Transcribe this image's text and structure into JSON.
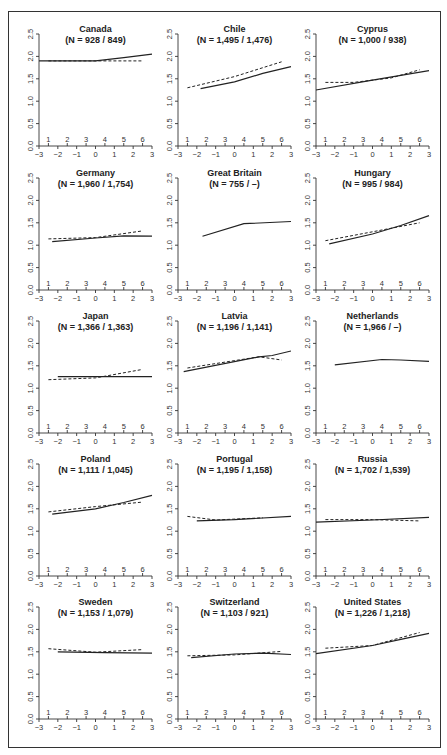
{
  "chart_data": {
    "type": "line",
    "layout": {
      "rows": 5,
      "cols": 3,
      "grid": false,
      "legend": "none"
    },
    "xlim": [
      -3,
      3
    ],
    "ylim": [
      0,
      2.5
    ],
    "x_ticks": [
      "−3",
      "−2",
      "−1",
      "0",
      "1",
      "2",
      "3"
    ],
    "y_ticks": [
      "0.0",
      "0.5",
      "1.0",
      "1.5",
      "2.0",
      "2.5"
    ],
    "inner_tick_labels": [
      "1",
      "2",
      "3",
      "4",
      "5",
      "6"
    ],
    "inner_tick_x": [
      -2.5,
      -1.5,
      -0.5,
      0.5,
      1.5,
      2.5
    ],
    "series_names": [
      "solid",
      "dashed"
    ],
    "panels": [
      {
        "title": "Canada",
        "n": "(N = 928 / 849)",
        "solid": [
          [
            -3,
            1.9
          ],
          [
            0,
            1.9
          ],
          [
            1.5,
            1.97
          ],
          [
            3,
            2.05
          ]
        ],
        "dashed": [
          [
            -2.5,
            1.9
          ],
          [
            2.5,
            1.9
          ]
        ]
      },
      {
        "title": "Chile",
        "n": "(N = 1,495 / 1,476)",
        "solid": [
          [
            -1.8,
            1.28
          ],
          [
            0,
            1.43
          ],
          [
            1.5,
            1.62
          ],
          [
            3,
            1.77
          ]
        ],
        "dashed": [
          [
            -2.5,
            1.3
          ],
          [
            0,
            1.55
          ],
          [
            2.5,
            1.88
          ]
        ]
      },
      {
        "title": "Cyprus",
        "n": "(N = 1,000 / 938)",
        "solid": [
          [
            -3,
            1.25
          ],
          [
            0,
            1.47
          ],
          [
            3,
            1.68
          ]
        ],
        "dashed": [
          [
            -2.5,
            1.42
          ],
          [
            -1,
            1.42
          ],
          [
            1,
            1.52
          ],
          [
            2.5,
            1.7
          ]
        ]
      },
      {
        "title": "Germany",
        "n": "(N = 1,960 / 1,754)",
        "solid": [
          [
            -2.3,
            1.08
          ],
          [
            0,
            1.16
          ],
          [
            1.5,
            1.21
          ],
          [
            3,
            1.2
          ]
        ],
        "dashed": [
          [
            -2.5,
            1.14
          ],
          [
            0,
            1.17
          ],
          [
            2.5,
            1.32
          ]
        ]
      },
      {
        "title": "Great Britain",
        "n": "(N = 755 / –)",
        "solid": [
          [
            -1.7,
            1.2
          ],
          [
            0.5,
            1.48
          ],
          [
            3,
            1.53
          ]
        ],
        "dashed": []
      },
      {
        "title": "Hungary",
        "n": "(N = 995 / 984)",
        "solid": [
          [
            -2.3,
            1.03
          ],
          [
            0,
            1.25
          ],
          [
            1.5,
            1.44
          ],
          [
            3,
            1.66
          ]
        ],
        "dashed": [
          [
            -2.5,
            1.1
          ],
          [
            0,
            1.3
          ],
          [
            2.5,
            1.5
          ]
        ]
      },
      {
        "title": "Japan",
        "n": "(N = 1,366 / 1,363)",
        "solid": [
          [
            -2,
            1.26
          ],
          [
            3,
            1.26
          ]
        ],
        "dashed": [
          [
            -2.5,
            1.19
          ],
          [
            0,
            1.23
          ],
          [
            2.5,
            1.42
          ]
        ]
      },
      {
        "title": "Latvia",
        "n": "(N = 1,196 / 1,141)",
        "solid": [
          [
            -2.7,
            1.37
          ],
          [
            1.3,
            1.7
          ],
          [
            2,
            1.73
          ],
          [
            3,
            1.83
          ]
        ],
        "dashed": [
          [
            -2.5,
            1.45
          ],
          [
            1.3,
            1.7
          ],
          [
            2.5,
            1.63
          ]
        ]
      },
      {
        "title": "Netherlands",
        "n": "(N = 1,966 / –)",
        "solid": [
          [
            -2,
            1.52
          ],
          [
            0.5,
            1.64
          ],
          [
            1.5,
            1.63
          ],
          [
            3,
            1.6
          ]
        ],
        "dashed": []
      },
      {
        "title": "Poland",
        "n": "(N = 1,111 / 1,045)",
        "solid": [
          [
            -2.3,
            1.38
          ],
          [
            0,
            1.5
          ],
          [
            1.5,
            1.64
          ],
          [
            3,
            1.8
          ]
        ],
        "dashed": [
          [
            -2.5,
            1.43
          ],
          [
            0,
            1.55
          ],
          [
            2.5,
            1.65
          ]
        ]
      },
      {
        "title": "Portugal",
        "n": "(N = 1,195 / 1,158)",
        "solid": [
          [
            -2,
            1.23
          ],
          [
            0,
            1.26
          ],
          [
            3,
            1.33
          ]
        ],
        "dashed": [
          [
            -2.5,
            1.33
          ],
          [
            -1,
            1.25
          ],
          [
            1.5,
            1.3
          ]
        ]
      },
      {
        "title": "Russia",
        "n": "(N = 1,702 / 1,539)",
        "solid": [
          [
            -3,
            1.2
          ],
          [
            0,
            1.25
          ],
          [
            3,
            1.31
          ]
        ],
        "dashed": [
          [
            -2.5,
            1.26
          ],
          [
            0,
            1.26
          ],
          [
            2.5,
            1.23
          ]
        ]
      },
      {
        "title": "Sweden",
        "n": "(N = 1,153 / 1,079)",
        "solid": [
          [
            -2,
            1.5
          ],
          [
            0.5,
            1.48
          ],
          [
            3,
            1.47
          ]
        ],
        "dashed": [
          [
            -2.5,
            1.57
          ],
          [
            0,
            1.49
          ],
          [
            2.5,
            1.55
          ]
        ]
      },
      {
        "title": "Switzerland",
        "n": "(N = 1,103 / 921)",
        "solid": [
          [
            -2.3,
            1.37
          ],
          [
            0,
            1.45
          ],
          [
            1.5,
            1.47
          ],
          [
            3,
            1.44
          ]
        ],
        "dashed": [
          [
            -2.5,
            1.41
          ],
          [
            0,
            1.43
          ],
          [
            2.5,
            1.51
          ]
        ]
      },
      {
        "title": "United States",
        "n": "(N = 1,226 / 1,218)",
        "solid": [
          [
            -3,
            1.46
          ],
          [
            0,
            1.64
          ],
          [
            1.5,
            1.78
          ],
          [
            3,
            1.91
          ]
        ],
        "dashed": [
          [
            -2.5,
            1.58
          ],
          [
            0,
            1.64
          ],
          [
            2.5,
            1.93
          ]
        ]
      }
    ]
  }
}
